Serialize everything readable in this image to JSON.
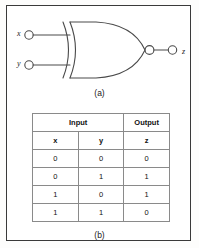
{
  "figure": {
    "border_color": "#3a3a3a",
    "line_color": "#4a4a4a",
    "background": "#ffffff"
  },
  "circuit": {
    "gate_type": "XOR",
    "has_output_bubble": true,
    "inputs": [
      {
        "label": "x"
      },
      {
        "label": "y"
      }
    ],
    "output": {
      "label": "z"
    },
    "caption": "(a)"
  },
  "truth_table": {
    "caption": "(b)",
    "group_headers": [
      {
        "label": "Input",
        "span": 2
      },
      {
        "label": "Output",
        "span": 1
      }
    ],
    "column_headers": [
      "x",
      "y",
      "z"
    ],
    "rows": [
      [
        "0",
        "0",
        "0"
      ],
      [
        "0",
        "1",
        "1"
      ],
      [
        "1",
        "0",
        "1"
      ],
      [
        "1",
        "1",
        "0"
      ]
    ]
  }
}
